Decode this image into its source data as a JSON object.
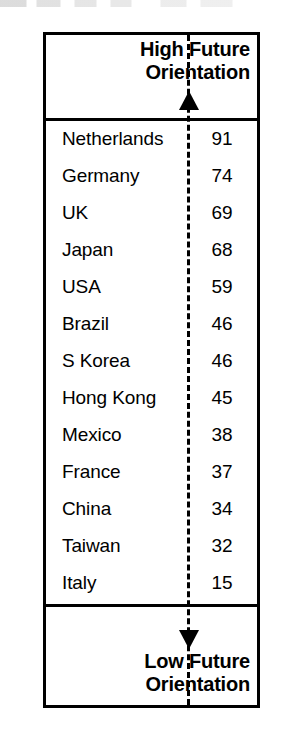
{
  "figure": {
    "type": "ranked-scale-diagram",
    "top_label": "High Future\nOrientation",
    "top_label_line1": "High Future",
    "top_label_line2": "Orientation",
    "bottom_label_line1": "Low Future",
    "bottom_label_line2": "Orientation",
    "axis_style": "dashed",
    "axis_color": "#000000",
    "border_color": "#000000",
    "background_color": "#ffffff"
  },
  "chart_data": {
    "type": "table",
    "title": "",
    "xlabel": "",
    "ylabel": "Future Orientation",
    "axis_top_annotation": "High Future Orientation",
    "axis_bottom_annotation": "Low Future Orientation",
    "grid": false,
    "legend": "none",
    "columns": [
      "Country",
      "Score"
    ],
    "categories": [
      "Netherlands",
      "Germany",
      "UK",
      "Japan",
      "USA",
      "Brazil",
      "S Korea",
      "Hong Kong",
      "Mexico",
      "France",
      "China",
      "Taiwan",
      "Italy"
    ],
    "values": [
      91,
      74,
      69,
      68,
      59,
      46,
      46,
      45,
      38,
      37,
      34,
      32,
      15
    ],
    "rows": [
      {
        "country": "Netherlands",
        "value": "91"
      },
      {
        "country": "Germany",
        "value": "74"
      },
      {
        "country": "UK",
        "value": "69"
      },
      {
        "country": "Japan",
        "value": "68"
      },
      {
        "country": "USA",
        "value": "59"
      },
      {
        "country": "Brazil",
        "value": "46"
      },
      {
        "country": "S Korea",
        "value": "46"
      },
      {
        "country": "Hong Kong",
        "value": "45"
      },
      {
        "country": "Mexico",
        "value": "38"
      },
      {
        "country": "France",
        "value": "37"
      },
      {
        "country": "China",
        "value": "34"
      },
      {
        "country": "Taiwan",
        "value": "32"
      },
      {
        "country": "Italy",
        "value": "15"
      }
    ],
    "ylim": [
      15,
      91
    ]
  }
}
